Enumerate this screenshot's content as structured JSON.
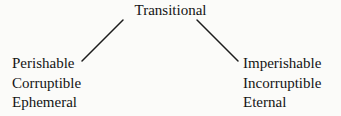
{
  "diagram": {
    "type": "tree",
    "root": {
      "label": "Transitional"
    },
    "branches": [
      {
        "side": "left",
        "items": [
          {
            "label": "Perishable"
          },
          {
            "label": "Corruptible"
          },
          {
            "label": "Ephemeral"
          }
        ]
      },
      {
        "side": "right",
        "items": [
          {
            "label": "Imperishable"
          },
          {
            "label": "Incorruptible"
          },
          {
            "label": "Eternal"
          }
        ]
      }
    ],
    "connectors": [
      {
        "name": "left-connector",
        "x1": 123,
        "y1": 20,
        "x2": 82,
        "y2": 61
      },
      {
        "name": "right-connector",
        "x1": 197,
        "y1": 20,
        "x2": 238,
        "y2": 61
      }
    ],
    "colors": {
      "background": "#fbfbf9",
      "text": "#141414",
      "line": "#1c1c1c"
    }
  }
}
